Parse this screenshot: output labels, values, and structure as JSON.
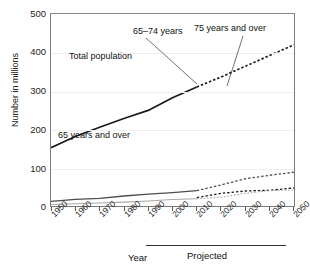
{
  "chart_data": {
    "type": "line",
    "title": "",
    "xlabel": "Year",
    "ylabel": "Number in millions",
    "ylim": [
      0,
      500
    ],
    "xlim": [
      1950,
      2050
    ],
    "yticks": [
      0,
      100,
      200,
      300,
      400,
      500
    ],
    "xticks": [
      1950,
      1960,
      1970,
      1980,
      1990,
      2000,
      2010,
      2020,
      2030,
      2040,
      2050
    ],
    "grid": true,
    "legend_position": "inline-annotations",
    "projected_from": 2010,
    "projected_label": "Projected",
    "series": [
      {
        "name": "Total population",
        "color": "#1a1a1a",
        "x": [
          1950,
          1960,
          1970,
          1980,
          1990,
          2000,
          2010,
          2020,
          2030,
          2040,
          2050
        ],
        "values": [
          152,
          181,
          205,
          228,
          249,
          282,
          310,
          336,
          364,
          392,
          420
        ],
        "observed_through": 2010
      },
      {
        "name": "65 years and over",
        "color": "#4d4d4d",
        "x": [
          1950,
          1960,
          1970,
          1980,
          1990,
          2000,
          2010,
          2020,
          2030,
          2040,
          2050
        ],
        "values": [
          12,
          17,
          20,
          26,
          31,
          35,
          40,
          55,
          71,
          80,
          88
        ],
        "observed_through": 2010
      },
      {
        "name": "65–74 years",
        "color": "#1a1a1a",
        "x": [
          2010,
          2020,
          2030,
          2040,
          2050
        ],
        "values": [
          22,
          33,
          39,
          41,
          47
        ],
        "observed_through": 2010
      },
      {
        "name": "75 years and over",
        "color": "#a8a8a8",
        "x": [
          1950,
          1960,
          1970,
          1980,
          1990,
          2000,
          2010,
          2020,
          2030,
          2040,
          2050
        ],
        "values": [
          4,
          6,
          8,
          10,
          13,
          17,
          19,
          23,
          33,
          40,
          42
        ]
      }
    ],
    "annotations": [
      {
        "text": "Total population",
        "x": 1964,
        "y": 255
      },
      {
        "text": "65 years and over",
        "x": 1962,
        "y": 72
      },
      {
        "text": "65–74 years",
        "x": 1988,
        "y": 120
      },
      {
        "text": "75 years and over",
        "x": 2016,
        "y": 128
      }
    ]
  },
  "axis": {
    "y_label": "Number in millions",
    "y_ticks": [
      "500",
      "400",
      "300",
      "200",
      "100",
      "0"
    ],
    "x_ticks": [
      "1950",
      "1960",
      "1970",
      "1980",
      "1990",
      "2000",
      "2010",
      "2020",
      "2030",
      "2040",
      "2050"
    ],
    "x_label": "Year",
    "projected_label": "Projected"
  },
  "labels": {
    "total_population": "Total population",
    "sixty_five_and_over": "65 years and over",
    "sixty_five_to_seventy_four": "65–74 years",
    "seventy_five_and_over": "75 years and over"
  }
}
